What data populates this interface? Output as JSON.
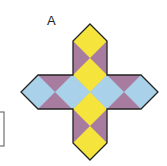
{
  "figure": {
    "label": "A",
    "colors": {
      "yellow": "#f4e43c",
      "blue": "#a9d2ea",
      "purple": "#a77c9f",
      "outline": "#222222"
    }
  }
}
